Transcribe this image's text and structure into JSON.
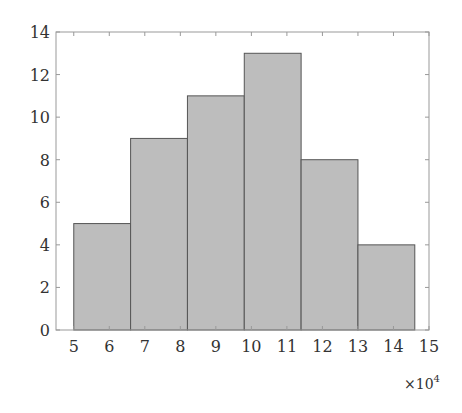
{
  "chart_data": {
    "type": "bar",
    "subtype": "histogram",
    "title": "",
    "xlabel": "",
    "ylabel": "",
    "x_multiplier_label": "×10",
    "x_multiplier_exponent": "4",
    "bin_edges": [
      5.0,
      6.6,
      8.2,
      9.8,
      11.4,
      13.0,
      14.6
    ],
    "values": [
      5,
      9,
      11,
      13,
      8,
      4
    ],
    "xlim": [
      4.5,
      15
    ],
    "ylim": [
      0,
      14
    ],
    "xticks": [
      5,
      6,
      7,
      8,
      9,
      10,
      11,
      12,
      13,
      14,
      15
    ],
    "yticks": [
      0,
      2,
      4,
      6,
      8,
      10,
      12,
      14
    ],
    "grid": false,
    "legend": null,
    "colors": {
      "bar_fill": "#bdbdbd",
      "bar_edge": "#555555",
      "axis": "#999999",
      "text": "#333333"
    }
  }
}
